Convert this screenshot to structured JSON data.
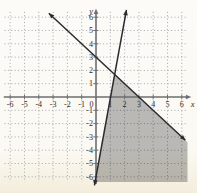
{
  "chart_data": {
    "type": "line",
    "title": "",
    "xlabel": "x",
    "ylabel": "y",
    "xlim": [
      -6,
      6
    ],
    "ylim": [
      -6,
      6
    ],
    "grid": "dotted",
    "x_tick_values": [
      -6,
      -5,
      -4,
      -3,
      -2,
      -1,
      0,
      1,
      2,
      3,
      4,
      5,
      6
    ],
    "x_tick_labels": [
      "-6",
      "-5",
      "-4",
      "-3",
      "-2",
      "-1",
      "0",
      "1",
      "2",
      "3",
      "4",
      "5",
      "6"
    ],
    "y_tick_values": [
      6,
      5,
      4,
      3,
      2,
      1,
      -1,
      -2,
      -3,
      -4,
      -5,
      -6
    ],
    "y_tick_labels": [
      "6",
      "5",
      "4",
      "3",
      "2",
      "1",
      "-1",
      "-2",
      "-3",
      "-4",
      "-5",
      "-6"
    ],
    "series": [
      {
        "name": "boundary-line-1",
        "equation": "y = -x + 3",
        "slope": -1,
        "y_intercept": 3,
        "x_intercept": 3,
        "style": "solid",
        "arrows": "both",
        "draw_from": [
          -3.3,
          6.3
        ],
        "draw_to": [
          6.25,
          -3.25
        ]
      },
      {
        "name": "boundary-line-2",
        "equation": "y = 6x - 6",
        "slope": 6,
        "y_intercept": -6,
        "x_intercept": 1,
        "style": "solid",
        "arrows": "both",
        "draw_from": [
          2.13,
          6.55
        ],
        "draw_to": [
          -0.11,
          -6.65
        ]
      }
    ],
    "shaded_region": {
      "satisfies": [
        "y <= -x + 3",
        "y <= 6x - 6"
      ],
      "vertex": [
        1.29,
        1.71
      ],
      "polygon": [
        [
          1.2857,
          1.7143
        ],
        [
          6.4,
          -3.4
        ],
        [
          6.4,
          -6.4
        ],
        [
          -0.0667,
          -6.4
        ]
      ],
      "fill": "gray"
    },
    "colors": {
      "background": "#fbf9f4",
      "grid": "#a4a7ae",
      "axis": "#6e6e70",
      "line": "#2b2b2f",
      "shade": "#000000",
      "shade_opacity": "0.26",
      "label": "#2e2c2a"
    }
  }
}
